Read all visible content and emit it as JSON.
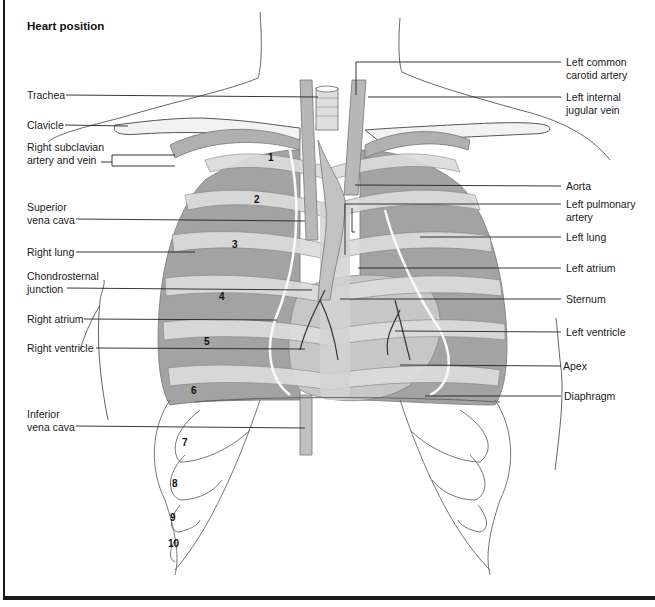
{
  "title": "Heart position",
  "colors": {
    "lung": "#9a9a9a",
    "rib": "#d8d8d8",
    "vessel": "#b5b5b5",
    "heart": "#c8c8c8",
    "line": "#222222",
    "frame": "#1a1a1a"
  },
  "left_labels": [
    {
      "id": "trachea",
      "lines": [
        "Trachea"
      ]
    },
    {
      "id": "clavicle",
      "lines": [
        "Clavicle"
      ]
    },
    {
      "id": "right-subclavian",
      "lines": [
        "Right subclavian",
        "artery and vein"
      ]
    },
    {
      "id": "superior-vena-cava",
      "lines": [
        "Superior",
        "vena cava"
      ]
    },
    {
      "id": "right-lung",
      "lines": [
        "Right lung"
      ]
    },
    {
      "id": "chondrosternal-junction",
      "lines": [
        "Chondrosternal",
        "junction"
      ]
    },
    {
      "id": "right-atrium",
      "lines": [
        "Right atrium"
      ]
    },
    {
      "id": "right-ventricle",
      "lines": [
        "Right ventricle"
      ]
    },
    {
      "id": "inferior-vena-cava",
      "lines": [
        "Inferior",
        "vena cava"
      ]
    }
  ],
  "right_labels": [
    {
      "id": "left-common-carotid",
      "lines": [
        "Left common",
        "carotid artery"
      ]
    },
    {
      "id": "left-internal-jugular",
      "lines": [
        "Left internal",
        "jugular vein"
      ]
    },
    {
      "id": "aorta",
      "lines": [
        "Aorta"
      ]
    },
    {
      "id": "left-pulmonary-artery",
      "lines": [
        "Left pulmonary",
        "artery"
      ]
    },
    {
      "id": "left-lung",
      "lines": [
        "Left lung"
      ]
    },
    {
      "id": "left-atrium",
      "lines": [
        "Left atrium"
      ]
    },
    {
      "id": "sternum",
      "lines": [
        "Sternum"
      ]
    },
    {
      "id": "left-ventricle",
      "lines": [
        "Left ventricle"
      ]
    },
    {
      "id": "apex",
      "lines": [
        "Apex"
      ]
    },
    {
      "id": "diaphragm",
      "lines": [
        "Diaphragm"
      ]
    }
  ],
  "rib_numbers": [
    "1",
    "2",
    "3",
    "4",
    "5",
    "6",
    "7",
    "8",
    "9",
    "10"
  ]
}
